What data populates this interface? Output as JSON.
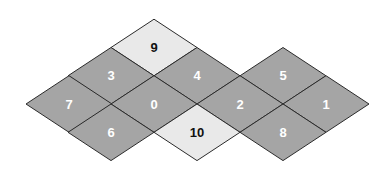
{
  "diagram": {
    "type": "rhombus-lattice",
    "geometry": {
      "origin_x": 26,
      "origin_y": 104,
      "half_width": 43,
      "half_height": 28.3
    },
    "colors": {
      "dark_fill": "#a5a5a5",
      "light_fill": "#e9e9e9",
      "stroke": "#2b2b2b",
      "dark_text": "#ffffff",
      "light_text": "#111111",
      "background": "#ffffff"
    },
    "cells": [
      {
        "label": "9",
        "cx": 154,
        "cy": 47.5,
        "shade": "light"
      },
      {
        "label": "3",
        "cx": 111,
        "cy": 75.8,
        "shade": "dark"
      },
      {
        "label": "4",
        "cx": 197,
        "cy": 75.8,
        "shade": "dark"
      },
      {
        "label": "5",
        "cx": 283,
        "cy": 75.8,
        "shade": "dark"
      },
      {
        "label": "7",
        "cx": 69,
        "cy": 104,
        "shade": "dark"
      },
      {
        "label": "0",
        "cx": 154,
        "cy": 104,
        "shade": "dark"
      },
      {
        "label": "2",
        "cx": 240,
        "cy": 104,
        "shade": "dark"
      },
      {
        "label": "1",
        "cx": 326,
        "cy": 104,
        "shade": "dark"
      },
      {
        "label": "6",
        "cx": 111,
        "cy": 132.3,
        "shade": "dark"
      },
      {
        "label": "10",
        "cx": 197,
        "cy": 132.3,
        "shade": "light"
      },
      {
        "label": "8",
        "cx": 283,
        "cy": 132.3,
        "shade": "dark"
      }
    ]
  }
}
